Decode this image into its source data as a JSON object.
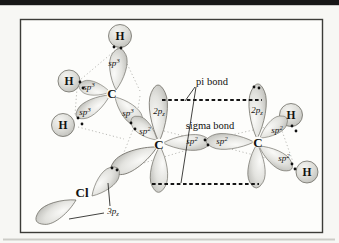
{
  "page": {
    "top_bar_color": "#171717",
    "bottom_rule_color": "#c6c6c2",
    "background": "#f7f7f4",
    "box_background": "#fdfdfb",
    "frame_color": "#3c3c38"
  },
  "diagram": {
    "annotations": {
      "pi_bond": "pi bond",
      "sigma_bond": "sigma bond"
    },
    "atom_labels": {
      "carbons": [
        "C",
        "C",
        "C"
      ],
      "hydrogens": [
        "H",
        "H",
        "H",
        "H",
        "H"
      ],
      "chlorine": "Cl"
    },
    "orbital_labels": {
      "sp3": {
        "base": "sp",
        "script": "3"
      },
      "sp2": {
        "base": "sp",
        "script": "2"
      },
      "p2z": {
        "base": "2p",
        "script": "z"
      },
      "p3z": {
        "base": "3p",
        "script": "z"
      }
    },
    "colors": {
      "lobe_fill_center": "#fafaf8",
      "lobe_fill_edge": "#b7b7b2",
      "lobe_stroke": "#706e66",
      "dashed_overlap_line": "#151515",
      "guide_dots": "#aaaaa5"
    }
  }
}
